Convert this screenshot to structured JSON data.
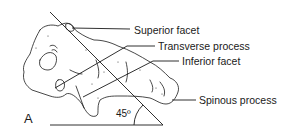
{
  "figure": {
    "panel_label": "A",
    "angle_label": "45º",
    "labels": [
      {
        "id": "superior-facet",
        "text": "Superior facet"
      },
      {
        "id": "transverse-process",
        "text": "Transverse process"
      },
      {
        "id": "inferior-facet",
        "text": "Inferior facet"
      },
      {
        "id": "spinous-process",
        "text": "Spinous process"
      }
    ],
    "colors": {
      "ink": "#1a1a1a",
      "background": "#ffffff"
    }
  }
}
